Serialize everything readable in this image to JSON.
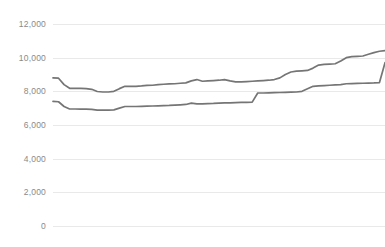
{
  "chart_data": {
    "type": "line",
    "title": "",
    "subtitle": "",
    "xlabel": "",
    "ylabel": "",
    "ylim": [
      0,
      12000
    ],
    "xlim": [
      0,
      60
    ],
    "grid": true,
    "legend": "none",
    "y_ticks": [
      0,
      2000,
      4000,
      6000,
      8000,
      10000,
      12000
    ],
    "y_tick_labels": [
      "0",
      "2,000",
      "4,000",
      "6,000",
      "8,000",
      "10,000",
      "12,000"
    ],
    "x_tick_labels": [],
    "series": [
      {
        "name": "upper-series",
        "color": "#757575",
        "x": [
          0,
          1,
          2,
          3,
          4,
          5,
          6,
          7,
          8,
          9,
          10,
          11,
          12,
          13,
          14,
          15,
          16,
          17,
          18,
          19,
          20,
          21,
          22,
          23,
          24,
          25,
          26,
          27,
          28,
          29,
          30,
          31,
          32,
          33,
          34,
          35,
          36,
          37,
          38,
          39,
          40,
          41,
          42,
          43,
          44,
          45,
          46,
          47,
          48,
          49,
          50,
          51,
          52,
          53,
          54,
          55,
          56,
          57,
          58,
          59,
          60
        ],
        "values": [
          8800,
          8780,
          8400,
          8180,
          8180,
          8170,
          8160,
          8120,
          7990,
          7960,
          7960,
          8000,
          8160,
          8300,
          8300,
          8300,
          8320,
          8350,
          8360,
          8400,
          8420,
          8440,
          8450,
          8480,
          8500,
          8620,
          8700,
          8600,
          8620,
          8640,
          8660,
          8700,
          8620,
          8560,
          8560,
          8580,
          8600,
          8620,
          8640,
          8660,
          8700,
          8800,
          9000,
          9150,
          9200,
          9220,
          9240,
          9380,
          9560,
          9600,
          9620,
          9640,
          9800,
          10000,
          10060,
          10080,
          10100,
          10200,
          10300,
          10380,
          10420
        ]
      },
      {
        "name": "lower-series",
        "color": "#757575",
        "x": [
          0,
          1,
          2,
          3,
          4,
          5,
          6,
          7,
          8,
          9,
          10,
          11,
          12,
          13,
          14,
          15,
          16,
          17,
          18,
          19,
          20,
          21,
          22,
          23,
          24,
          25,
          26,
          27,
          28,
          29,
          30,
          31,
          32,
          33,
          34,
          35,
          36,
          37,
          38,
          39,
          40,
          41,
          42,
          43,
          44,
          45,
          46,
          47,
          48,
          49,
          50,
          51,
          52,
          53,
          54,
          55,
          56,
          57,
          58,
          59,
          60
        ],
        "values": [
          7400,
          7380,
          7100,
          6950,
          6950,
          6940,
          6940,
          6930,
          6880,
          6880,
          6880,
          6900,
          7000,
          7100,
          7100,
          7100,
          7110,
          7120,
          7130,
          7140,
          7150,
          7160,
          7180,
          7200,
          7220,
          7300,
          7250,
          7260,
          7270,
          7280,
          7300,
          7320,
          7320,
          7330,
          7340,
          7350,
          7360,
          7900,
          7900,
          7910,
          7920,
          7930,
          7940,
          7950,
          7960,
          8000,
          8150,
          8300,
          8320,
          8340,
          8360,
          8380,
          8400,
          8450,
          8460,
          8470,
          8480,
          8490,
          8500,
          8520,
          9700
        ]
      }
    ]
  }
}
